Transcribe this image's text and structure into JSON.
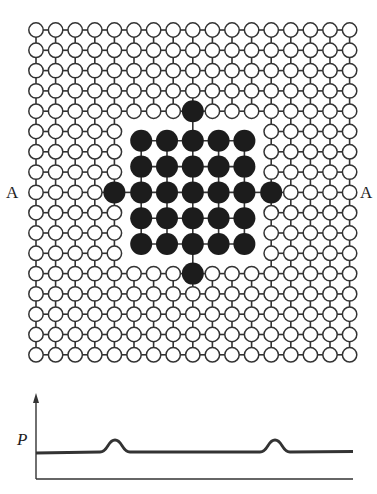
{
  "diagram": {
    "labels": {
      "section_left": "A",
      "section_right": "A",
      "potential_axis": "P"
    },
    "colors": {
      "ink": "#333333",
      "dark_atom": "#1c1c1c",
      "light_atom_fill": "#ffffff",
      "background": "#ffffff"
    },
    "lattice": {
      "columns": 17,
      "rows": 17,
      "origin_x": 36,
      "origin_y": 30,
      "spacing_x": 19.6,
      "spacing_y": 20.3,
      "atom_radius": 7.2,
      "vacancy_region": {
        "col_from": 5,
        "col_to": 11,
        "row_from": 5,
        "row_to": 11
      },
      "substituted_sites": [
        {
          "col": 8,
          "row": 4,
          "position": "top"
        },
        {
          "col": 8,
          "row": 12,
          "position": "bottom"
        },
        {
          "col": 4,
          "row": 8,
          "position": "left"
        },
        {
          "col": 12,
          "row": 8,
          "position": "right"
        }
      ]
    },
    "cluster": {
      "columns": 5,
      "rows": 5,
      "center_x": 192.8,
      "center_y": 192.4,
      "spacing": 25.8,
      "atom_radius": 11
    },
    "profile": {
      "axis_origin": {
        "x": 36,
        "y": 479
      },
      "y_axis_top": 393,
      "x_axis_end": 353,
      "baseline_y": 452,
      "peak_y": 440,
      "peaks_x": [
        115,
        275
      ],
      "peak_half_width": 15,
      "line_end_x": 353
    }
  }
}
